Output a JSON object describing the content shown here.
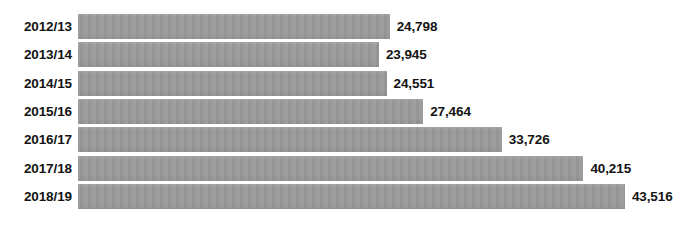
{
  "chart_data": {
    "type": "bar",
    "orientation": "horizontal",
    "title": "",
    "subtitle": "",
    "xlabel": "",
    "ylabel": "",
    "categories": [
      "2012/13",
      "2013/14",
      "2014/15",
      "2015/16",
      "2016/17",
      "2017/18",
      "2018/19"
    ],
    "values": [
      24798,
      23945,
      24551,
      27464,
      33726,
      40215,
      43516
    ],
    "value_labels": [
      "24,798",
      "23,945",
      "24,551",
      "27,464",
      "33,726",
      "40,215",
      "43,516"
    ],
    "xlim": [
      0,
      43516
    ],
    "grid": false,
    "legend": null,
    "axis_ticks_visible": false,
    "bar_color": "#9a9a9a",
    "text_color": "#131313",
    "background_color": "#ffffff"
  },
  "layout": {
    "bar_origin_x": 78,
    "bar_height": 25,
    "row_pitch": 28.3,
    "first_row_top": 14,
    "pixels_per_unit": 0.012568,
    "label_gap": 7,
    "category_column_width": 72
  }
}
